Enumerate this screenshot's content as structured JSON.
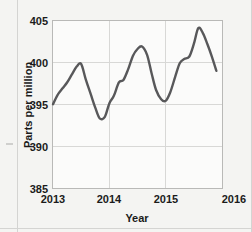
{
  "chart_data": {
    "type": "line",
    "title": "",
    "xlabel": "Year",
    "ylabel": "Parts per million",
    "xlim": [
      2013,
      2016
    ],
    "ylim": [
      385,
      405
    ],
    "xticks": [
      "2013",
      "2014",
      "2015",
      "2016"
    ],
    "xtick_values": [
      2013,
      2014,
      2015,
      2016
    ],
    "yticks": [
      "385",
      "390",
      "395",
      "400",
      "405"
    ],
    "ytick_values": [
      385,
      390,
      395,
      400,
      405
    ],
    "grid": true,
    "legend": "none",
    "series": [
      {
        "name": "Carbon dioxide concentration",
        "color": "#58585a",
        "x": [
          2013.0,
          2013.08,
          2013.17,
          2013.25,
          2013.33,
          2013.42,
          2013.5,
          2013.58,
          2013.67,
          2013.75,
          2013.83,
          2013.92,
          2014.0,
          2014.08,
          2014.17,
          2014.25,
          2014.33,
          2014.42,
          2014.5,
          2014.58,
          2014.67,
          2014.75,
          2014.83,
          2014.92,
          2015.0,
          2015.08,
          2015.17,
          2015.25,
          2015.33,
          2015.42,
          2015.5,
          2015.58
        ],
        "y": [
          395.0,
          396.1,
          396.9,
          397.6,
          398.5,
          399.5,
          399.8,
          398.0,
          396.2,
          394.6,
          393.3,
          393.5,
          395.1,
          396.0,
          397.6,
          397.9,
          399.1,
          400.8,
          401.6,
          401.9,
          400.9,
          398.7,
          396.7,
          395.6,
          395.4,
          396.4,
          398.3,
          399.9,
          400.4,
          400.7,
          402.2,
          404.1
        ],
        "y_end_note": [
          403.5,
          402.2,
          400.7,
          399.0
        ]
      }
    ]
  },
  "axis": {
    "y_label": "Parts per million",
    "x_label": "Year"
  }
}
